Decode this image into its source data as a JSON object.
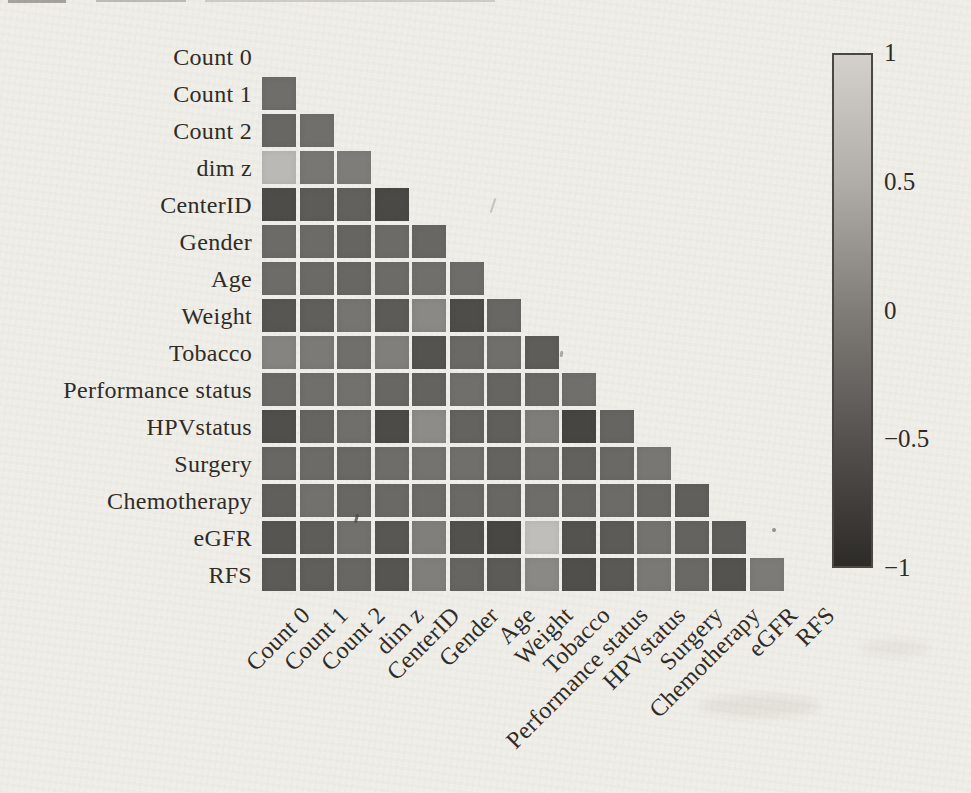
{
  "figure": {
    "kind": "scanned correlation heatmap figure",
    "background_color": "#f0eee9",
    "ink_color": "#2f2c27"
  },
  "chart_data": {
    "type": "heatmap",
    "title": "",
    "xlabel": "",
    "ylabel": "",
    "shape": "lower-triangular, diagonal masked",
    "colormap": "grayscale (light = 1, dark = -1)",
    "value_range": [
      -1,
      1
    ],
    "categories": [
      "Count 0",
      "Count 1",
      "Count 2",
      "dim z",
      "CenterID",
      "Gender",
      "Age",
      "Weight",
      "Tobacco",
      "Performance status",
      "HPVstatus",
      "Surgery",
      "Chemotherapy",
      "eGFR",
      "RFS"
    ],
    "rows": [
      {
        "label": "Count 1",
        "values": [
          -0.2
        ]
      },
      {
        "label": "Count 2",
        "values": [
          -0.29,
          -0.19
        ]
      },
      {
        "label": "dim z",
        "values": [
          0.7,
          -0.1,
          -0.02
        ]
      },
      {
        "label": "CenterID",
        "values": [
          -0.61,
          -0.42,
          -0.36,
          -0.65
        ]
      },
      {
        "label": "Gender",
        "values": [
          -0.24,
          -0.24,
          -0.31,
          -0.24,
          -0.29
        ]
      },
      {
        "label": "Age",
        "values": [
          -0.23,
          -0.25,
          -0.29,
          -0.24,
          -0.19,
          -0.22
        ]
      },
      {
        "label": "Weight",
        "values": [
          -0.49,
          -0.38,
          -0.12,
          -0.43,
          0.12,
          -0.6,
          -0.29
        ]
      },
      {
        "label": "Tobacco",
        "values": [
          0.06,
          -0.06,
          -0.19,
          0.0,
          -0.53,
          -0.26,
          -0.19,
          -0.41
        ]
      },
      {
        "label": "Performance status",
        "values": [
          -0.26,
          -0.19,
          -0.17,
          -0.29,
          -0.34,
          -0.19,
          -0.31,
          -0.26,
          -0.19
        ]
      },
      {
        "label": "HPVstatus",
        "values": [
          -0.57,
          -0.31,
          -0.19,
          -0.62,
          0.15,
          -0.34,
          -0.38,
          -0.02,
          -0.69,
          -0.31
        ]
      },
      {
        "label": "Surgery",
        "values": [
          -0.29,
          -0.24,
          -0.26,
          -0.22,
          -0.14,
          -0.19,
          -0.34,
          -0.17,
          -0.36,
          -0.26,
          -0.1
        ]
      },
      {
        "label": "Chemotherapy",
        "values": [
          -0.38,
          -0.17,
          -0.29,
          -0.26,
          -0.24,
          -0.26,
          -0.29,
          -0.22,
          -0.31,
          -0.24,
          -0.29,
          -0.38
        ]
      },
      {
        "label": "eGFR",
        "values": [
          -0.5,
          -0.41,
          -0.17,
          -0.48,
          0.0,
          -0.55,
          -0.67,
          0.75,
          -0.53,
          -0.43,
          -0.14,
          -0.34,
          -0.41
        ]
      },
      {
        "label": "RFS",
        "values": [
          -0.43,
          -0.38,
          -0.29,
          -0.5,
          0.0,
          -0.31,
          -0.43,
          0.12,
          -0.57,
          -0.46,
          -0.07,
          -0.26,
          -0.53,
          -0.05
        ]
      }
    ],
    "colorbar": {
      "position": "right",
      "ticks": [
        {
          "label": "1",
          "value": 1
        },
        {
          "label": "0.5",
          "value": 0.5
        },
        {
          "label": "0",
          "value": 0
        },
        {
          "label": "−0.5",
          "value": -0.5
        },
        {
          "label": "−1",
          "value": -1
        }
      ]
    },
    "legend": "none",
    "grid": "off"
  }
}
